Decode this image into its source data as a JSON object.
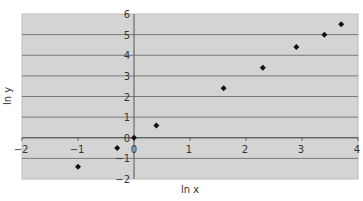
{
  "chart_data": {
    "type": "scatter",
    "title": "",
    "xlabel": "ln x",
    "ylabel": "ln y",
    "xlim": [
      -2,
      4
    ],
    "ylim": [
      -2,
      6
    ],
    "xticks": [
      -2,
      -1,
      0,
      1,
      2,
      3,
      4
    ],
    "yticks": [
      -2,
      -1,
      0,
      1,
      2,
      3,
      4,
      5,
      6
    ],
    "grid": {
      "horizontal": true,
      "vertical": false
    },
    "legend": null,
    "series": [
      {
        "name": "data",
        "marker": "diamond",
        "color": "#111111",
        "points": [
          {
            "x": -1.0,
            "y": -1.4
          },
          {
            "x": -0.3,
            "y": -0.5
          },
          {
            "x": 0.0,
            "y": 0.0
          },
          {
            "x": 0.4,
            "y": 0.6
          },
          {
            "x": 1.6,
            "y": 2.4
          },
          {
            "x": 2.3,
            "y": 3.4
          },
          {
            "x": 2.9,
            "y": 4.4
          },
          {
            "x": 3.4,
            "y": 5.0
          },
          {
            "x": 3.7,
            "y": 5.5
          }
        ]
      }
    ]
  },
  "style": {
    "plot_background": "#d4d4d4",
    "gridline_color": "#7a7a7a",
    "axis_color": "#555555",
    "marker_color": "#111111"
  }
}
